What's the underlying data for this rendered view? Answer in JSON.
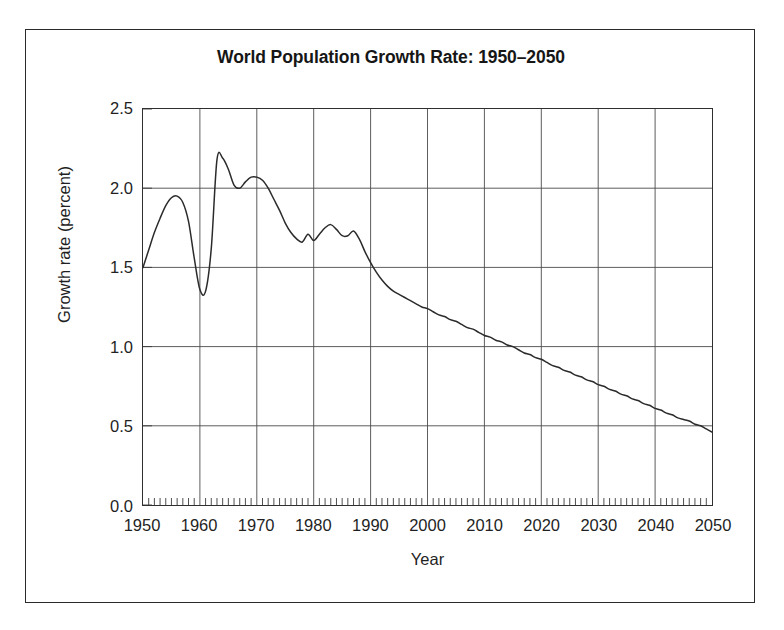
{
  "chart_data": {
    "type": "line",
    "title": "World Population Growth Rate: 1950–2050",
    "xlabel": "Year",
    "ylabel": "Growth rate (percent)",
    "xlim": [
      1950,
      2050
    ],
    "ylim": [
      0.0,
      2.5
    ],
    "grid": true,
    "legend": "none",
    "x_major_ticks": [
      1950,
      1960,
      1970,
      1980,
      1990,
      2000,
      2010,
      2020,
      2030,
      2040,
      2050
    ],
    "x_tick_labels": [
      "1950",
      "1960",
      "1970",
      "1980",
      "1990",
      "2000",
      "2010",
      "2020",
      "2030",
      "2040",
      "2050"
    ],
    "x_minor_tick_interval": 1,
    "y_major_ticks": [
      0.0,
      0.5,
      1.0,
      1.5,
      2.0,
      2.5
    ],
    "y_tick_labels": [
      "0.0",
      "0.5",
      "1.0",
      "1.5",
      "2.0",
      "2.5"
    ],
    "line_color": "#2b2b2b",
    "series": [
      {
        "name": "World population growth rate",
        "x": [
          1950,
          1951,
          1952,
          1953,
          1954,
          1955,
          1956,
          1957,
          1958,
          1959,
          1960,
          1961,
          1962,
          1963,
          1964,
          1965,
          1966,
          1967,
          1968,
          1969,
          1970,
          1971,
          1972,
          1973,
          1974,
          1975,
          1976,
          1977,
          1978,
          1979,
          1980,
          1981,
          1982,
          1983,
          1984,
          1985,
          1986,
          1987,
          1988,
          1989,
          1990,
          1991,
          1992,
          1993,
          1994,
          1995,
          1996,
          1997,
          1998,
          1999,
          2000,
          2001,
          2002,
          2003,
          2004,
          2005,
          2006,
          2007,
          2008,
          2009,
          2010,
          2011,
          2012,
          2013,
          2014,
          2015,
          2016,
          2017,
          2018,
          2019,
          2020,
          2021,
          2022,
          2023,
          2024,
          2025,
          2026,
          2027,
          2028,
          2029,
          2030,
          2031,
          2032,
          2033,
          2034,
          2035,
          2036,
          2037,
          2038,
          2039,
          2040,
          2041,
          2042,
          2043,
          2044,
          2045,
          2046,
          2047,
          2048,
          2049,
          2050
        ],
        "y": [
          1.5,
          1.61,
          1.72,
          1.81,
          1.89,
          1.94,
          1.95,
          1.91,
          1.79,
          1.56,
          1.36,
          1.35,
          1.62,
          2.18,
          2.19,
          2.12,
          2.02,
          2.0,
          2.04,
          2.07,
          2.07,
          2.05,
          2.0,
          1.93,
          1.86,
          1.78,
          1.72,
          1.68,
          1.66,
          1.71,
          1.67,
          1.71,
          1.75,
          1.77,
          1.74,
          1.7,
          1.7,
          1.73,
          1.68,
          1.6,
          1.53,
          1.47,
          1.42,
          1.38,
          1.35,
          1.33,
          1.31,
          1.29,
          1.27,
          1.25,
          1.24,
          1.22,
          1.2,
          1.19,
          1.17,
          1.16,
          1.14,
          1.12,
          1.11,
          1.09,
          1.07,
          1.06,
          1.04,
          1.03,
          1.01,
          1.0,
          0.98,
          0.96,
          0.95,
          0.93,
          0.92,
          0.9,
          0.88,
          0.87,
          0.85,
          0.84,
          0.82,
          0.81,
          0.79,
          0.78,
          0.76,
          0.75,
          0.73,
          0.72,
          0.7,
          0.69,
          0.67,
          0.66,
          0.64,
          0.63,
          0.61,
          0.6,
          0.58,
          0.57,
          0.55,
          0.54,
          0.53,
          0.51,
          0.5,
          0.48,
          0.46
        ]
      }
    ],
    "annotations": {
      "peak_1963": 2.19,
      "trough_1960": 1.35,
      "start_1950": 1.5,
      "end_2050": 0.46
    }
  }
}
